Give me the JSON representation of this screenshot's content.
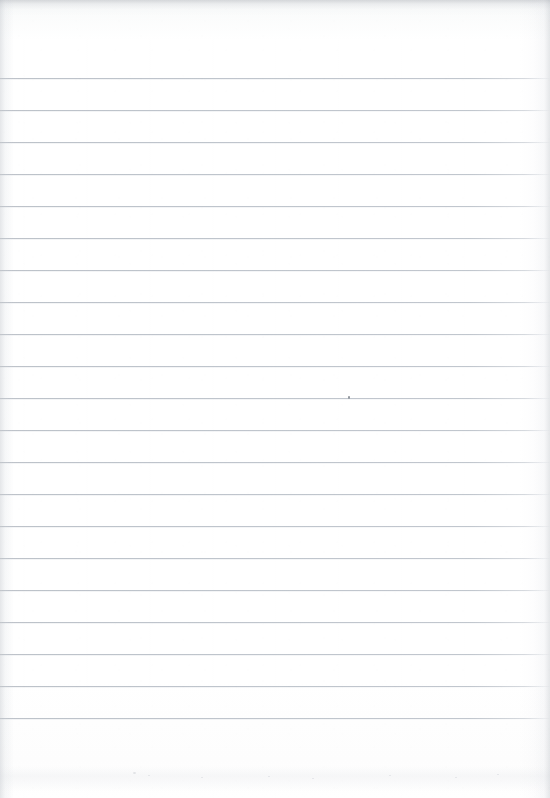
{
  "document": {
    "kind": "scanned-lined-notebook-page",
    "title": "Blank ruled paper scan",
    "page_text": "",
    "written_content": [],
    "width_px": 550,
    "height_px": 798
  },
  "paper": {
    "background_color": "#ffffff",
    "tint_color": "#fafbfb",
    "top_edge_shade_color": "#a8acb2",
    "left_edge_shade_color": "#babec4",
    "right_edge_shade_color": "#b4b8be"
  },
  "ruling": {
    "line_color": "#bcc2ca",
    "line_thickness_px": 1,
    "line_spacing_px": 32,
    "first_line_y_px": 78,
    "last_line_y_px": 718,
    "line_count": 21,
    "left_margin_x_px": 0,
    "right_end_x_px": 550,
    "has_vertical_margin_rule": false,
    "line_y_positions": [
      78,
      110,
      142,
      174,
      206,
      238,
      270,
      302,
      334,
      366,
      398,
      430,
      462,
      494,
      526,
      558,
      590,
      622,
      654,
      686,
      718
    ]
  },
  "artifacts": {
    "speck": {
      "x_px": 348,
      "y_px": 396,
      "color": "#969ba2"
    },
    "bottom_smudge": {
      "y_px": 766,
      "color": "#e4e6e9"
    },
    "bottom_flecks": [
      {
        "x_px": 133,
        "y_px": 772,
        "size_px": 3
      },
      {
        "x_px": 148,
        "y_px": 775,
        "size_px": 2
      },
      {
        "x_px": 201,
        "y_px": 777,
        "size_px": 2
      },
      {
        "x_px": 268,
        "y_px": 776,
        "size_px": 2
      },
      {
        "x_px": 312,
        "y_px": 778,
        "size_px": 2
      },
      {
        "x_px": 389,
        "y_px": 775,
        "size_px": 2
      },
      {
        "x_px": 455,
        "y_px": 777,
        "size_px": 2
      },
      {
        "x_px": 497,
        "y_px": 774,
        "size_px": 2
      }
    ]
  }
}
